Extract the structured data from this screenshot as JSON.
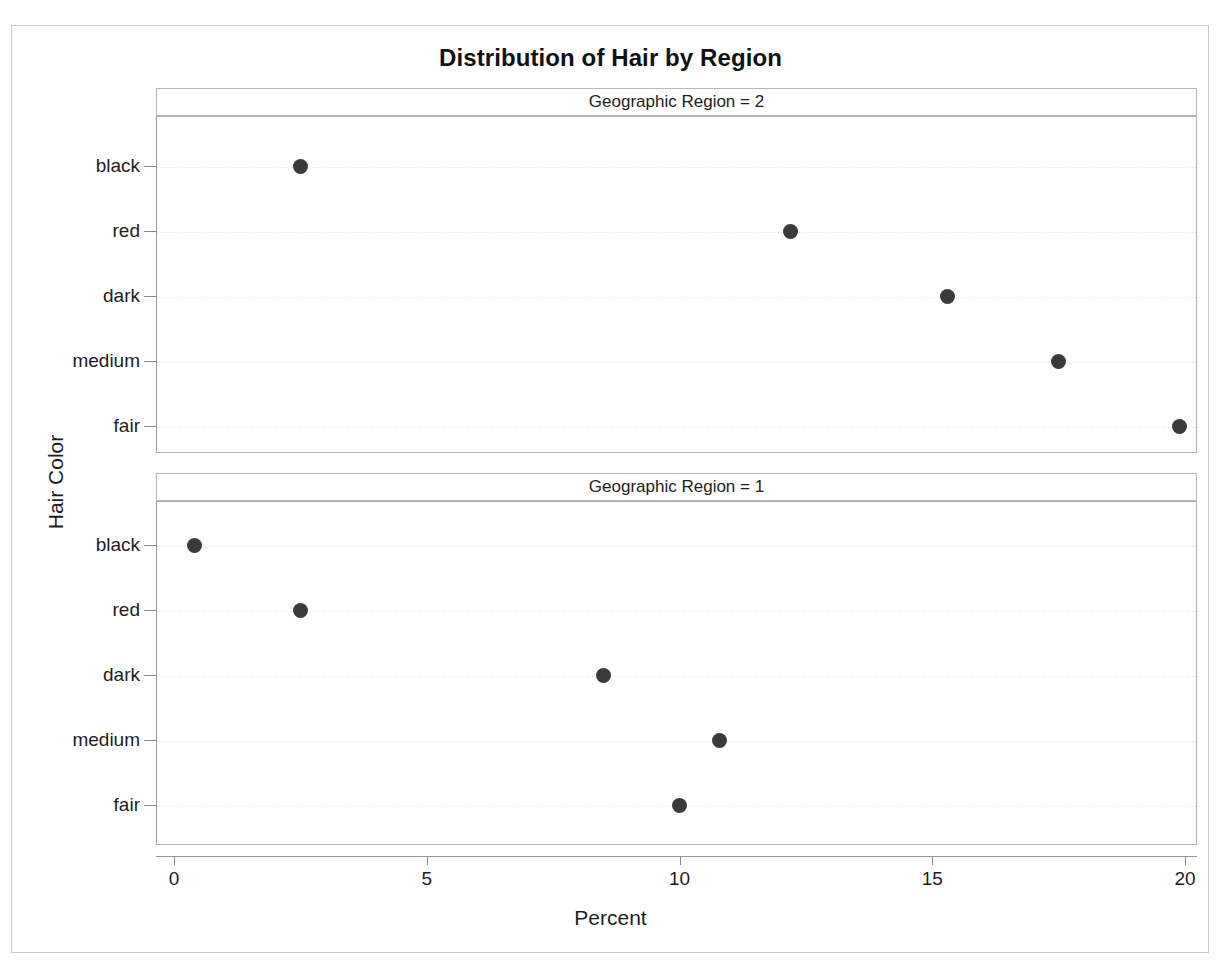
{
  "chart_data": {
    "type": "scatter",
    "title": "Distribution of Hair by Region",
    "xlabel": "Percent",
    "ylabel": "Hair Color",
    "xlim": [
      0,
      20
    ],
    "xticks": [
      0,
      5,
      10,
      15,
      20
    ],
    "xtick_labels": [
      "0",
      "5",
      "10",
      "15",
      "20"
    ],
    "categories": [
      "black",
      "red",
      "dark",
      "medium",
      "fair"
    ],
    "grid": true,
    "legend": "none",
    "marker_color": "#3a3a3a",
    "panel_variable": "Geographic Region",
    "panels": [
      {
        "header": "Geographic Region = 2",
        "region": "2",
        "categories": [
          "black",
          "red",
          "dark",
          "medium",
          "fair"
        ],
        "values": [
          2.5,
          12.2,
          15.3,
          17.5,
          19.9
        ]
      },
      {
        "header": "Geographic Region = 1",
        "region": "1",
        "categories": [
          "black",
          "red",
          "dark",
          "medium",
          "fair"
        ],
        "values": [
          0.4,
          2.5,
          8.5,
          10.8,
          10.0
        ]
      }
    ]
  },
  "page": {
    "title": "Distribution of Hair by Region",
    "xaxis_title": "Percent",
    "yaxis_title": "Hair Color",
    "panel1_header": "Geographic Region = 2",
    "panel2_header": "Geographic Region = 1",
    "ytick_black": "black",
    "ytick_red": "red",
    "ytick_dark": "dark",
    "ytick_medium": "medium",
    "ytick_fair": "fair",
    "xtick_0": "0",
    "xtick_5": "5",
    "xtick_10": "10",
    "xtick_15": "15",
    "xtick_20": "20"
  }
}
